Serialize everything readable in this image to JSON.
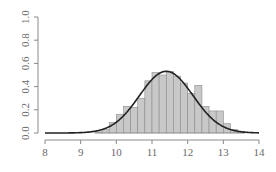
{
  "chart_data": {
    "type": "bar",
    "subtype": "histogram-with-density-curve",
    "title": "",
    "xlabel": "",
    "ylabel": "",
    "xlim": [
      8,
      14
    ],
    "ylim": [
      0,
      1.0
    ],
    "x_ticks": [
      8,
      9,
      10,
      11,
      12,
      13,
      14
    ],
    "y_ticks": [
      "0.0",
      "0.2",
      "0.4",
      "0.6",
      "0.8",
      "1.0"
    ],
    "grid": false,
    "legend": null,
    "bin_width": 0.2,
    "bins": [
      {
        "x0": 9.4,
        "x1": 9.6,
        "density": 0.01
      },
      {
        "x0": 9.6,
        "x1": 9.8,
        "density": 0.03
      },
      {
        "x0": 9.8,
        "x1": 10.0,
        "density": 0.09
      },
      {
        "x0": 10.0,
        "x1": 10.2,
        "density": 0.16
      },
      {
        "x0": 10.2,
        "x1": 10.4,
        "density": 0.23
      },
      {
        "x0": 10.4,
        "x1": 10.6,
        "density": 0.22
      },
      {
        "x0": 10.6,
        "x1": 10.8,
        "density": 0.3
      },
      {
        "x0": 10.8,
        "x1": 11.0,
        "density": 0.45
      },
      {
        "x0": 11.0,
        "x1": 11.2,
        "density": 0.52
      },
      {
        "x0": 11.2,
        "x1": 11.4,
        "density": 0.5
      },
      {
        "x0": 11.4,
        "x1": 11.6,
        "density": 0.53
      },
      {
        "x0": 11.6,
        "x1": 11.8,
        "density": 0.49
      },
      {
        "x0": 11.8,
        "x1": 12.0,
        "density": 0.43
      },
      {
        "x0": 12.0,
        "x1": 12.2,
        "density": 0.34
      },
      {
        "x0": 12.2,
        "x1": 12.4,
        "density": 0.41
      },
      {
        "x0": 12.4,
        "x1": 12.6,
        "density": 0.23
      },
      {
        "x0": 12.6,
        "x1": 12.8,
        "density": 0.19
      },
      {
        "x0": 12.8,
        "x1": 13.0,
        "density": 0.19
      },
      {
        "x0": 13.0,
        "x1": 13.2,
        "density": 0.08
      },
      {
        "x0": 13.2,
        "x1": 13.4,
        "density": 0.03
      },
      {
        "x0": 13.4,
        "x1": 13.6,
        "density": 0.01
      }
    ],
    "series": [
      {
        "name": "histogram",
        "kind": "bar",
        "color": "#c8c8c8"
      },
      {
        "name": "normal density",
        "kind": "line",
        "color": "#222222",
        "mean": 11.4,
        "sd": 0.75,
        "x_range": [
          8,
          14
        ]
      }
    ]
  },
  "colors": {
    "bar_fill": "#c8c8c8",
    "bar_edge": "#8c8c8c",
    "curve": "#222222",
    "axis": "#8a8a8a",
    "tick_text": "#6a6a6a"
  }
}
